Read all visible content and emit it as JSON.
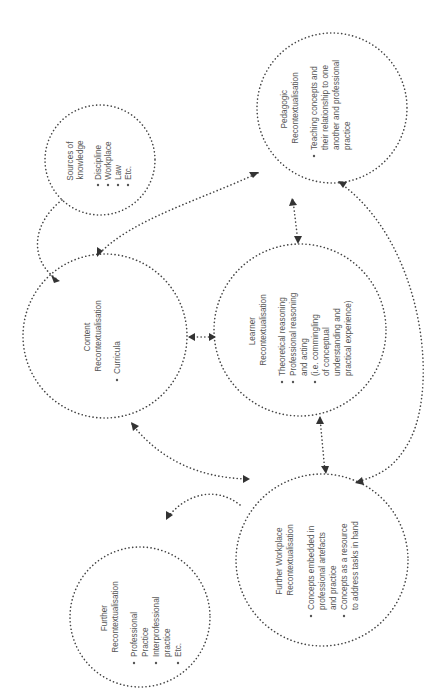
{
  "diagram": {
    "orientation": "rotated 90 degrees counter-clockwise",
    "nodes": {
      "sources": {
        "title": [
          "Sources of",
          "knowledge"
        ],
        "items": [
          [
            "Discipline"
          ],
          [
            "Workplace"
          ],
          [
            "Law"
          ],
          [
            "Etc."
          ]
        ]
      },
      "pedagogic": {
        "title": [
          "Pedagogic",
          "Recontextualisation"
        ],
        "items": [
          [
            "Teaching concepts and",
            "their relationship to one",
            "another and professional",
            "practice"
          ]
        ]
      },
      "content": {
        "title": [
          "Content",
          "Recontextualisation"
        ],
        "items": [
          [
            "Curricula"
          ]
        ]
      },
      "learner": {
        "title": [
          "Learner",
          "Recontextualisation"
        ],
        "items": [
          [
            "Theoretical reasoning"
          ],
          [
            "Professional reasoning",
            "and acting"
          ],
          [
            "(i.e. commingling",
            "of conceptual",
            "understanding and",
            "practical experience)"
          ]
        ]
      },
      "workplace": {
        "title": [
          "Further Workplace",
          "Recontextualisation"
        ],
        "items": [
          [
            "Concepts embedded in",
            "professional artefacts",
            "and practice"
          ],
          [
            "Concepts as a resource",
            "to address tasks in hand"
          ]
        ]
      },
      "further": {
        "title": [
          "Further",
          "Recontextualisation"
        ],
        "items": [
          [
            "Professional",
            "Practice"
          ],
          [
            "Interprofessional",
            "practice"
          ],
          [
            "Etc."
          ]
        ]
      }
    },
    "connections": [
      {
        "from": "sources",
        "to": "content",
        "type": "arrow"
      },
      {
        "from": "pedagogic",
        "to": "content",
        "type": "double-arrow"
      },
      {
        "from": "content",
        "to": "learner",
        "type": "double-arrow"
      },
      {
        "from": "pedagogic",
        "to": "learner",
        "type": "double-arrow"
      },
      {
        "from": "learner",
        "to": "workplace",
        "type": "double-arrow"
      },
      {
        "from": "pedagogic",
        "to": "workplace",
        "type": "double-arrow"
      },
      {
        "from": "content",
        "to": "workplace",
        "type": "double-arrow"
      },
      {
        "from": "workplace",
        "to": "further",
        "type": "arrow"
      }
    ],
    "colors": {
      "stroke": "#444444",
      "text": "#555555",
      "background": "#ffffff"
    }
  }
}
